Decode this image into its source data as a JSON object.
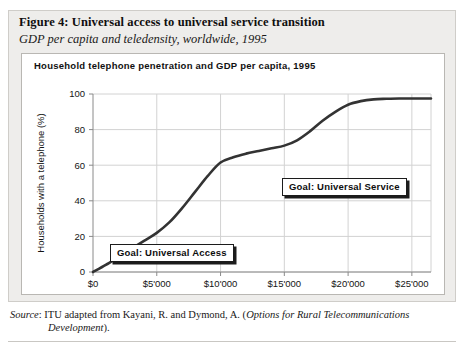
{
  "figure": {
    "title": "Figure 4:  Universal access to universal service transition",
    "subtitle": "GDP per capita and teledensity, worldwide, 1995"
  },
  "source": {
    "label": "Source",
    "separator": ": ",
    "text": "ITU adapted from Kayani, R. and Dymond, A. (",
    "work": "Options for Rural Telecommunications",
    "work_line2": "Development",
    "closing": ")."
  },
  "callouts": {
    "universal_access": "Goal: Universal Access",
    "universal_service": "Goal: Universal Service"
  },
  "chart_data": {
    "type": "line",
    "title": "Household telephone penetration and GDP per capita, 1995",
    "xlabel": "GDP per capita, US$",
    "ylabel": "Households with a telephone (%)",
    "xlim": [
      0,
      26500
    ],
    "ylim": [
      0,
      100
    ],
    "grid": true,
    "legend": "none",
    "xticks": [
      0,
      5000,
      10000,
      15000,
      20000,
      25000
    ],
    "xticklabels": [
      "$0",
      "$5'000",
      "$10'000",
      "$15'000",
      "$20'000",
      "$25'000"
    ],
    "yticks": [
      0,
      20,
      40,
      60,
      80,
      100
    ],
    "yticklabels": [
      "0",
      "20",
      "40",
      "60",
      "80",
      "100"
    ],
    "series": [
      {
        "name": "Household telephone penetration",
        "color": "#333333",
        "x": [
          0,
          1000,
          2000,
          3000,
          4000,
          5000,
          6000,
          7000,
          8000,
          9000,
          10000,
          11000,
          12000,
          13000,
          14000,
          15000,
          16000,
          17000,
          18000,
          19000,
          20000,
          21000,
          22000,
          23000,
          24000,
          25000,
          26500
        ],
        "y": [
          0,
          4,
          8.5,
          13,
          17.5,
          22,
          28,
          36,
          45,
          54,
          61.5,
          64.5,
          66.5,
          68,
          69.5,
          71,
          74,
          79,
          85,
          90,
          94,
          96,
          97,
          97.3,
          97.5,
          97.5,
          97.5
        ]
      }
    ],
    "annotations": [
      {
        "text": "Goal: Universal Access",
        "x": 5200,
        "y": 30
      },
      {
        "text": "Goal: Universal Service",
        "x": 15500,
        "y": 72
      }
    ]
  }
}
